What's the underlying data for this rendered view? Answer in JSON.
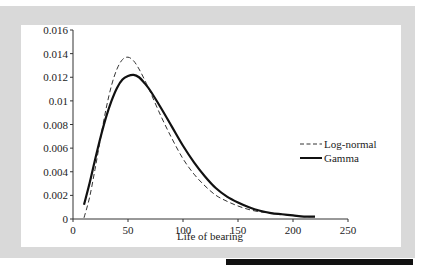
{
  "chart_data": {
    "type": "line",
    "title": "",
    "xlabel": "Life of bearing",
    "ylabel": "",
    "xlim": [
      0,
      250
    ],
    "ylim": [
      0,
      0.016
    ],
    "x_ticks": [
      0,
      50,
      100,
      150,
      200,
      250
    ],
    "x_tick_labels": [
      "0",
      "50",
      "100",
      "150",
      "200",
      "250"
    ],
    "y_ticks": [
      0,
      0.002,
      0.004,
      0.006,
      0.008,
      0.01,
      0.012,
      0.014,
      0.016
    ],
    "y_tick_labels": [
      "0",
      "0.002",
      "0.004",
      "0.006",
      "0.008",
      "0.01",
      "0.012",
      "0.014",
      "0.016"
    ],
    "grid": false,
    "legend_position": "right",
    "series": [
      {
        "name": "Log-normal",
        "style": "dashed",
        "color": "#333333",
        "x": [
          10,
          15,
          20,
          25,
          30,
          35,
          40,
          45,
          50,
          55,
          60,
          65,
          70,
          80,
          90,
          100,
          110,
          120,
          130,
          140,
          150,
          160,
          170,
          180,
          190,
          200,
          210,
          220
        ],
        "y": [
          0.0001,
          0.0018,
          0.0042,
          0.0068,
          0.0093,
          0.0113,
          0.0127,
          0.0135,
          0.0137,
          0.0134,
          0.0127,
          0.0118,
          0.0108,
          0.0087,
          0.0068,
          0.0051,
          0.0038,
          0.0028,
          0.002,
          0.0015,
          0.0011,
          0.0008,
          0.0006,
          0.0005,
          0.0004,
          0.0003,
          0.0002,
          0.0002
        ]
      },
      {
        "name": "Gamma",
        "style": "solid",
        "color": "#111111",
        "x": [
          10,
          15,
          20,
          25,
          30,
          35,
          40,
          45,
          50,
          55,
          60,
          65,
          70,
          80,
          90,
          100,
          110,
          120,
          130,
          140,
          150,
          160,
          170,
          180,
          190,
          200,
          210,
          220
        ],
        "y": [
          0.0012,
          0.003,
          0.005,
          0.0069,
          0.0086,
          0.01,
          0.0111,
          0.0118,
          0.0121,
          0.0122,
          0.012,
          0.0115,
          0.0109,
          0.0094,
          0.0078,
          0.0062,
          0.0048,
          0.0036,
          0.0026,
          0.0019,
          0.0014,
          0.001,
          0.0007,
          0.0005,
          0.0004,
          0.0003,
          0.0002,
          0.0002
        ]
      }
    ]
  }
}
